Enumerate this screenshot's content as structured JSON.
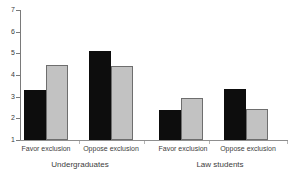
{
  "chart_data": {
    "type": "bar",
    "title": "",
    "subtitle": "",
    "xlabel": "",
    "ylabel": "",
    "ylim": [
      1,
      7
    ],
    "yticks": [
      "1",
      "2",
      "3",
      "4",
      "5",
      "6",
      "7"
    ],
    "grid": false,
    "legend": "none",
    "categories": [
      "Favor exclusion",
      "Oppose exclusion",
      "Favor exclusion",
      "Oppose exclusion"
    ],
    "groups": [
      {
        "label": "Undergraduates",
        "categories": [
          "Favor exclusion",
          "Oppose exclusion"
        ]
      },
      {
        "label": "Law students",
        "categories": [
          "Favor exclusion",
          "Oppose exclusion"
        ]
      }
    ],
    "series": [
      {
        "name": "black",
        "color": "#0d0d0d",
        "values": [
          3.3,
          5.1,
          2.4,
          3.35
        ]
      },
      {
        "name": "gray",
        "color": "#c2c2c2",
        "values": [
          4.45,
          4.4,
          2.95,
          2.45
        ]
      }
    ]
  },
  "axis": {
    "tick_7": "7",
    "tick_6": "6",
    "tick_5": "5",
    "tick_4": "4",
    "tick_3": "3",
    "tick_2": "2",
    "tick_1": "1"
  },
  "labels": {
    "cat_0": "Favor exclusion",
    "cat_1": "Oppose exclusion",
    "cat_2": "Favor exclusion",
    "cat_3": "Oppose exclusion",
    "group_0": "Undergraduates",
    "group_1": "Law students"
  }
}
